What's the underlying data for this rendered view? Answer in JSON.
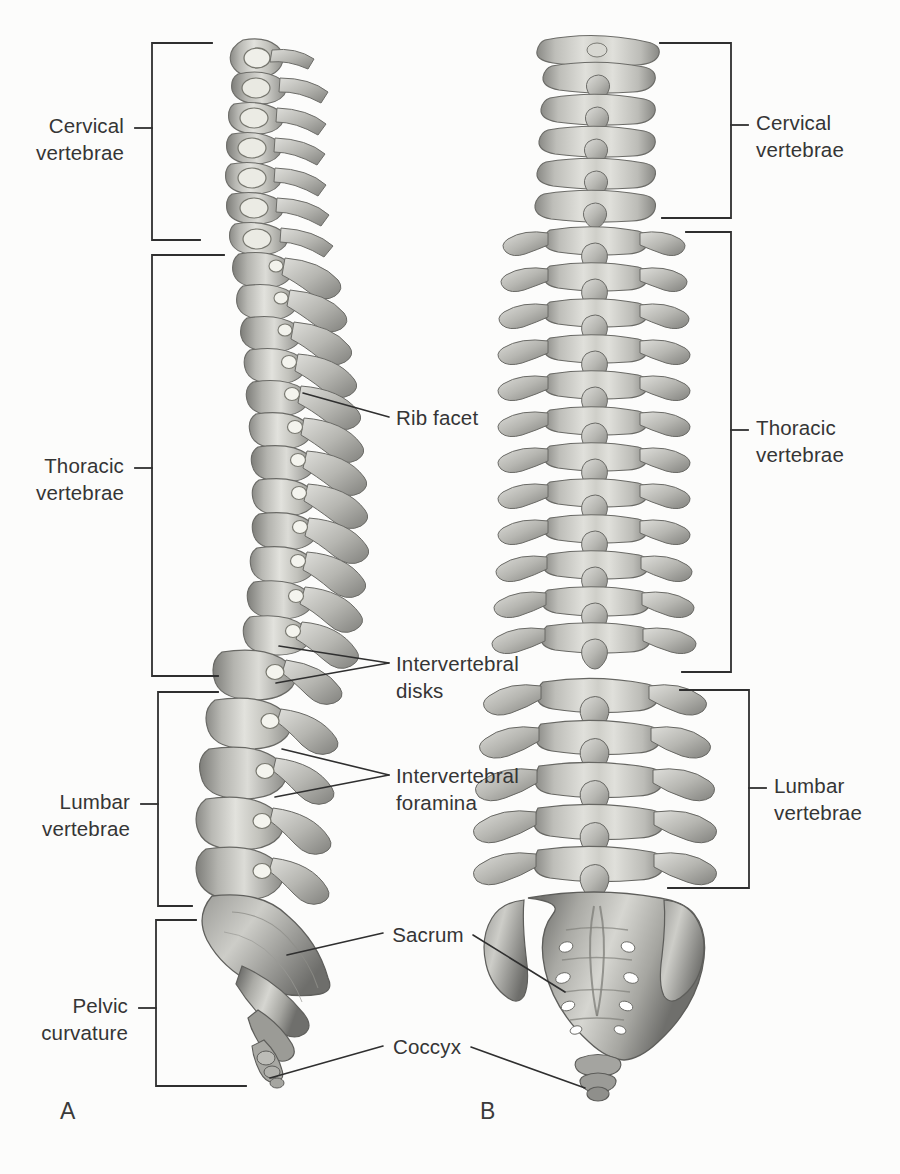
{
  "figure": {
    "background_color": "#fcfcfb",
    "ink_color": "#2f2f2f",
    "text_color": "#353535",
    "panels": [
      {
        "letter": "A",
        "view": "lateral (right side) view"
      },
      {
        "letter": "B",
        "view": "posterior view"
      }
    ]
  },
  "left_bracket_labels": [
    {
      "id": "cervical-left",
      "text": "Cervical\nvertebrae"
    },
    {
      "id": "thoracic-left",
      "text": "Thoracic\nvertebrae"
    },
    {
      "id": "lumbar-left",
      "text": "Lumbar\nvertebrae"
    },
    {
      "id": "pelvic-left",
      "text": "Pelvic\ncurvature"
    }
  ],
  "right_bracket_labels": [
    {
      "id": "cervical-right",
      "text": "Cervical\nvertebrae"
    },
    {
      "id": "thoracic-right",
      "text": "Thoracic\nvertebrae"
    },
    {
      "id": "lumbar-right",
      "text": "Lumbar\nvertebrae"
    }
  ],
  "leader_labels": [
    {
      "id": "rib-facet",
      "text": "Rib facet"
    },
    {
      "id": "intervertebral-disks",
      "text": "Intervertebral\ndisks"
    },
    {
      "id": "intervertebral-foramina",
      "text": "Intervertebral\nforamina"
    },
    {
      "id": "sacrum",
      "text": "Sacrum"
    },
    {
      "id": "coccyx",
      "text": "Coccyx"
    }
  ],
  "panel_letters": {
    "a": "A",
    "b": "B"
  }
}
